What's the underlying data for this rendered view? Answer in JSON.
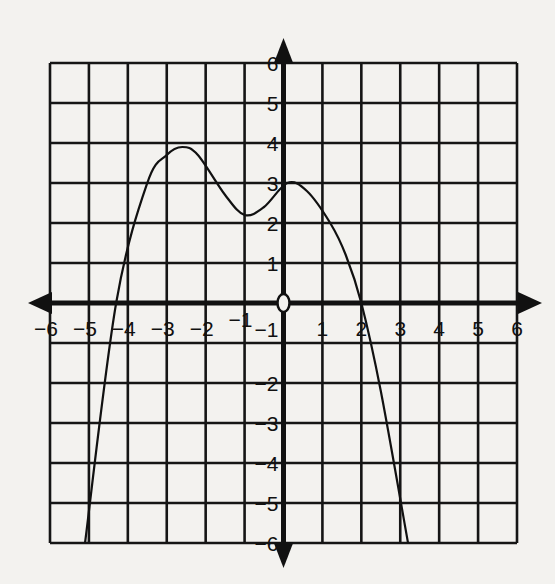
{
  "chart_data": {
    "type": "line",
    "title": "",
    "xlabel": "",
    "ylabel": "",
    "xlim": [
      -6,
      6
    ],
    "ylim": [
      -6,
      6
    ],
    "grid": true,
    "x_ticks": [
      "-6",
      "-5",
      "-4",
      "-3",
      "-2",
      "-1",
      "1",
      "2",
      "3",
      "4",
      "5",
      "6"
    ],
    "y_ticks": [
      "6",
      "5",
      "4",
      "3",
      "2",
      "1",
      "-1",
      "-2",
      "-3",
      "-4",
      "-5",
      "-6"
    ],
    "origin_label": "0",
    "series": [
      {
        "name": "f(x)",
        "x": [
          -5.1,
          -4.3,
          -3.5,
          -3.0,
          -2.6,
          -2.2,
          -1.5,
          -1.0,
          -0.5,
          0.1,
          0.6,
          1.2,
          1.6,
          2.0,
          2.5,
          3.2
        ],
        "y": [
          -6,
          0,
          3.0,
          3.7,
          3.9,
          3.7,
          2.7,
          2.2,
          2.4,
          3.0,
          2.8,
          2.0,
          1.2,
          0,
          -2.2,
          -6
        ]
      }
    ],
    "key_points": {
      "x_intercepts": [
        -4.3,
        2.0
      ],
      "y_intercept": 3,
      "local_max": [
        [
          -2.6,
          3.9
        ],
        [
          0.1,
          3.0
        ]
      ],
      "local_min": [
        [
          -1.0,
          2.2
        ]
      ]
    }
  }
}
